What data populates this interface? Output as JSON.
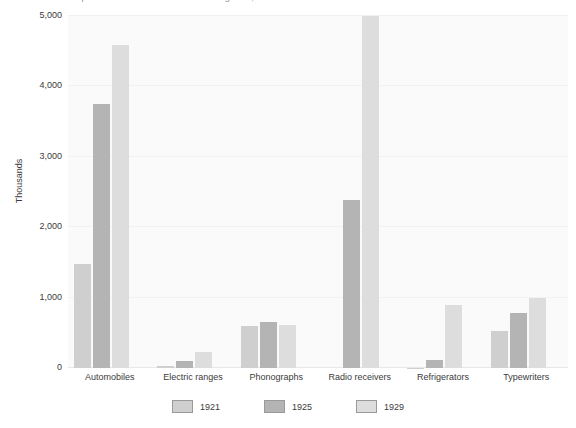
{
  "chart_data": {
    "type": "bar",
    "title": "U.S. production of selected consumer goods, 1921-1929",
    "subtitle": "",
    "xlabel": "",
    "ylabel": "Thousands",
    "ylim": [
      0,
      5000
    ],
    "yticks": [
      0,
      1000,
      2000,
      3000,
      4000,
      5000
    ],
    "ytick_labels": [
      "0",
      "1,000",
      "2,000",
      "3,000",
      "4,000",
      "5,000"
    ],
    "grid": true,
    "legend_position": "bottom",
    "categories": [
      "Automobiles",
      "Electric ranges",
      "Phonographs",
      "Radio receivers",
      "Refrigerators",
      "Typewriters"
    ],
    "series": [
      {
        "name": "1921",
        "color": "#cfcfcf",
        "values": [
          1475,
          30,
          600,
          0,
          5,
          520
        ]
      },
      {
        "name": "1925",
        "color": "#b4b4b4",
        "values": [
          3750,
          95,
          655,
          2380,
          110,
          780
        ]
      },
      {
        "name": "1929",
        "color": "#dddddd",
        "values": [
          4590,
          230,
          610,
          5000,
          900,
          1000
        ]
      }
    ]
  },
  "legend": {
    "items": [
      {
        "label": "1921",
        "color": "#cfcfcf"
      },
      {
        "label": "1925",
        "color": "#b4b4b4"
      },
      {
        "label": "1929",
        "color": "#dddddd"
      }
    ]
  },
  "colors": {
    "plot_background": "#fafafa",
    "gridline": "#f2f2f2",
    "text": "#3b3b3b",
    "series_1921": "#cfcfcf",
    "series_1925": "#b4b4b4",
    "series_1929": "#dddddd"
  }
}
